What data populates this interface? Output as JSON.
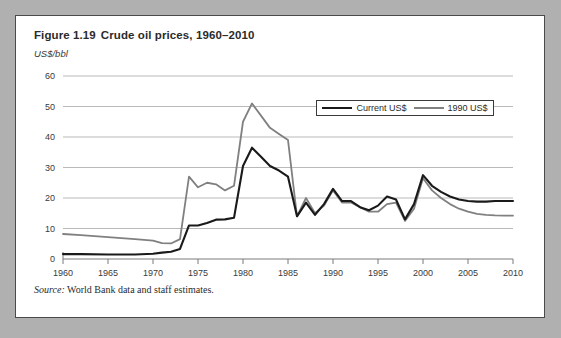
{
  "figure": {
    "number": "Figure 1.19",
    "title": "Crude oil prices, 1960–2010",
    "unit_label": "US$/bbl",
    "source_label": "Source:",
    "source_text": "World Bank data and staff estimates."
  },
  "legend": {
    "entries": [
      {
        "label": "Current US$",
        "color": "#1a1a1a"
      },
      {
        "label": "1990 US$",
        "color": "#808080"
      }
    ]
  },
  "chart_data": {
    "type": "line",
    "title": "Crude oil prices, 1960–2010",
    "xlabel": "",
    "ylabel": "US$/bbl",
    "xlim": [
      1960,
      2010
    ],
    "ylim": [
      0,
      60
    ],
    "yticks": [
      0,
      10,
      20,
      30,
      40,
      50,
      60
    ],
    "xticks": [
      1960,
      1965,
      1970,
      1975,
      1980,
      1985,
      1990,
      1995,
      2000,
      2005,
      2010
    ],
    "grid": true,
    "legend_position": "top-right-inside",
    "x": [
      1960,
      1961,
      1962,
      1963,
      1964,
      1965,
      1966,
      1967,
      1968,
      1969,
      1970,
      1971,
      1972,
      1973,
      1974,
      1975,
      1976,
      1977,
      1978,
      1979,
      1980,
      1981,
      1982,
      1983,
      1984,
      1985,
      1986,
      1987,
      1988,
      1989,
      1990,
      1991,
      1992,
      1993,
      1994,
      1995,
      1996,
      1997,
      1998,
      1999,
      2000,
      2001,
      2002,
      2003,
      2004,
      2005,
      2006,
      2007,
      2008,
      2009,
      2010
    ],
    "series": [
      {
        "name": "Current US$",
        "color": "#1a1a1a",
        "values": [
          1.6,
          1.6,
          1.6,
          1.6,
          1.5,
          1.5,
          1.5,
          1.5,
          1.5,
          1.6,
          1.7,
          2.1,
          2.4,
          3.3,
          11.2,
          11.0,
          11.8,
          12.9,
          13.0,
          18.7,
          30.5,
          35.9,
          32.4,
          29.2,
          28.2,
          26.9,
          14.0,
          17.9,
          14.3,
          17.3,
          22.3,
          18.6,
          18.5,
          16.3,
          15.6,
          17.0,
          20.4,
          19.1,
          12.8,
          17.9,
          28.2,
          24.4,
          25.0,
          28.9,
          37.7,
          53.4,
          64.3,
          71.1,
          97.0,
          61.8,
          79.0
        ]
      },
      {
        "name": "1990 US$",
        "color": "#808080",
        "values": [
          8.2,
          8.0,
          7.8,
          7.6,
          7.4,
          7.2,
          7.0,
          6.8,
          6.5,
          6.2,
          6.0,
          5.2,
          5.1,
          6.1,
          27.0,
          23.5,
          25.0,
          24.5,
          22.5,
          24.5,
          45.0,
          51.0,
          47.0,
          43.0,
          41.0,
          39.0,
          14.0,
          20.0,
          15.5,
          17.5,
          22.5,
          18.5,
          18.5,
          17.0,
          16.0,
          16.5,
          18.5,
          18.0,
          12.5,
          16.5,
          25.5,
          22.0,
          21.0,
          21.0,
          20.5,
          18.5,
          17.0,
          15.5,
          15.0,
          14.5,
          14.5
        ]
      }
    ],
    "render_series": [
      {
        "name": "Current US$",
        "points": [
          [
            1960,
            1.6
          ],
          [
            1962,
            1.6
          ],
          [
            1965,
            1.5
          ],
          [
            1968,
            1.5
          ],
          [
            1970,
            1.7
          ],
          [
            1971,
            2.1
          ],
          [
            1972,
            2.4
          ],
          [
            1973,
            3.3
          ],
          [
            1974,
            11.0
          ],
          [
            1975,
            11.0
          ],
          [
            1976,
            11.8
          ],
          [
            1977,
            12.9
          ],
          [
            1978,
            13.0
          ],
          [
            1979,
            13.5
          ],
          [
            1980,
            30.5
          ],
          [
            1981,
            36.5
          ],
          [
            1982,
            33.5
          ],
          [
            1983,
            30.5
          ],
          [
            1984,
            29.0
          ],
          [
            1985,
            27.0
          ],
          [
            1986,
            14.0
          ],
          [
            1987,
            18.5
          ],
          [
            1988,
            14.5
          ],
          [
            1989,
            18.0
          ],
          [
            1990,
            23.0
          ],
          [
            1991,
            19.0
          ],
          [
            1992,
            19.0
          ],
          [
            1993,
            17.0
          ],
          [
            1994,
            16.0
          ],
          [
            1995,
            17.5
          ],
          [
            1996,
            20.5
          ],
          [
            1997,
            19.5
          ],
          [
            1998,
            13.0
          ],
          [
            1999,
            18.0
          ],
          [
            2000,
            27.5
          ],
          [
            2001,
            24.0
          ],
          [
            2002,
            22.0
          ],
          [
            2003,
            20.5
          ],
          [
            2004,
            19.5
          ],
          [
            2005,
            19.0
          ],
          [
            2006,
            18.8
          ],
          [
            2007,
            18.8
          ],
          [
            2008,
            19.0
          ],
          [
            2009,
            19.0
          ],
          [
            2010,
            19.0
          ]
        ]
      },
      {
        "name": "1990 US$",
        "points": [
          [
            1960,
            8.2
          ],
          [
            1962,
            7.8
          ],
          [
            1965,
            7.2
          ],
          [
            1968,
            6.5
          ],
          [
            1970,
            6.0
          ],
          [
            1971,
            5.2
          ],
          [
            1972,
            5.1
          ],
          [
            1973,
            6.5
          ],
          [
            1974,
            27.0
          ],
          [
            1975,
            23.5
          ],
          [
            1976,
            25.0
          ],
          [
            1977,
            24.5
          ],
          [
            1978,
            22.5
          ],
          [
            1979,
            24.0
          ],
          [
            1980,
            45.0
          ],
          [
            1981,
            51.0
          ],
          [
            1982,
            47.0
          ],
          [
            1983,
            43.0
          ],
          [
            1984,
            41.0
          ],
          [
            1985,
            39.0
          ],
          [
            1986,
            14.0
          ],
          [
            1987,
            20.0
          ],
          [
            1988,
            15.0
          ],
          [
            1989,
            17.5
          ],
          [
            1990,
            22.5
          ],
          [
            1991,
            18.5
          ],
          [
            1992,
            18.5
          ],
          [
            1993,
            17.0
          ],
          [
            1994,
            15.5
          ],
          [
            1995,
            15.5
          ],
          [
            1996,
            18.0
          ],
          [
            1997,
            18.5
          ],
          [
            1998,
            12.5
          ],
          [
            1999,
            16.5
          ],
          [
            2000,
            26.5
          ],
          [
            2001,
            22.5
          ],
          [
            2002,
            20.0
          ],
          [
            2003,
            18.0
          ],
          [
            2004,
            16.5
          ],
          [
            2005,
            15.5
          ],
          [
            2006,
            14.8
          ],
          [
            2007,
            14.5
          ],
          [
            2008,
            14.3
          ],
          [
            2009,
            14.2
          ],
          [
            2010,
            14.2
          ]
        ]
      }
    ]
  }
}
